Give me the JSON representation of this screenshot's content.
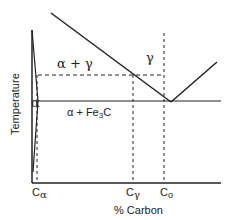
{
  "diagram": {
    "type": "phase-diagram",
    "y_axis_label": "Temperature",
    "x_axis_label": "% Carbon",
    "regions": {
      "alpha_gamma": "α + γ",
      "gamma": "γ",
      "alpha": "α",
      "alpha_fe3c": "α + Fe",
      "alpha_fe3c_sub": "3",
      "alpha_fe3c_tail": "C"
    },
    "x_ticks": {
      "c_alpha": "C",
      "c_alpha_sub": "α",
      "c_gamma": "C",
      "c_gamma_sub": "γ",
      "c_o": "C",
      "c_o_sub": "o"
    },
    "colors": {
      "line": "#222222",
      "background": "#ffffff"
    }
  }
}
